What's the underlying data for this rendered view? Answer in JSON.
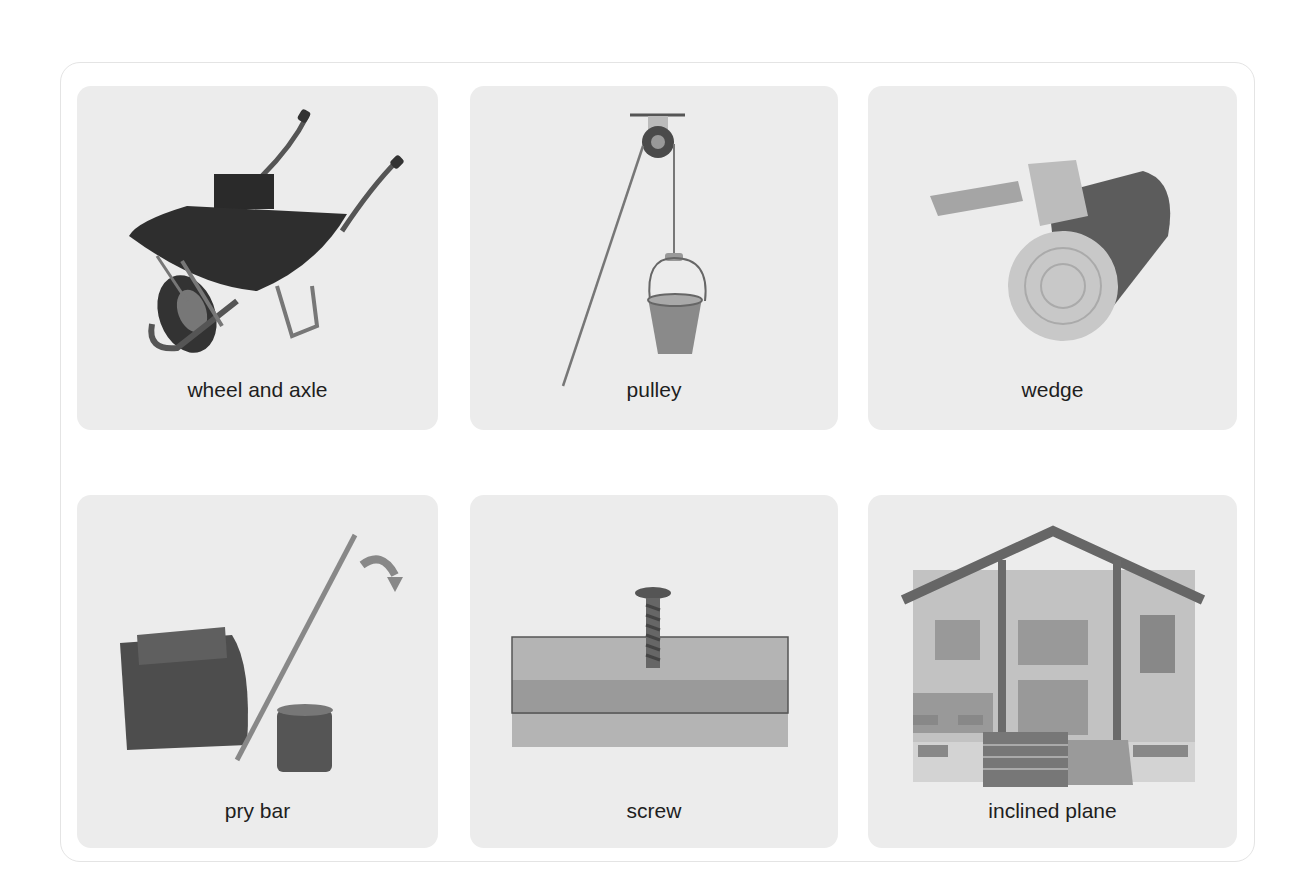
{
  "cards": [
    {
      "label": "wheel and axle",
      "icon": "wheelbarrow-icon"
    },
    {
      "label": "pulley",
      "icon": "pulley-bucket-icon"
    },
    {
      "label": "wedge",
      "icon": "axe-log-icon"
    },
    {
      "label": "pry bar",
      "icon": "lever-crowbar-icon"
    },
    {
      "label": "screw",
      "icon": "screw-in-wood-icon"
    },
    {
      "label": "inclined plane",
      "icon": "house-ramp-icon"
    }
  ],
  "colors": {
    "tile_background": "#ececec",
    "frame_border": "#e4e4e4",
    "label_text": "#1e1e1e"
  }
}
